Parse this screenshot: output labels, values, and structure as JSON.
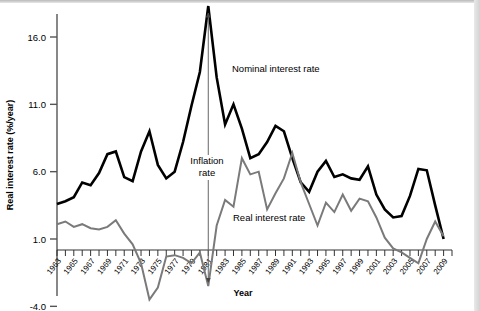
{
  "chart_data": {
    "type": "line",
    "title": "",
    "xlabel": "Year",
    "ylabel": "Real interest rate (%/year)",
    "ylim": [
      -4.0,
      18.8
    ],
    "xlim": [
      1963,
      2010
    ],
    "grid": false,
    "legend": "inline-labels",
    "ytick_labels": [
      "16.0",
      "11.0",
      "6.0",
      "1.0",
      "-4.0"
    ],
    "ytick_values": [
      16.0,
      11.0,
      6.0,
      1.0,
      -4.0
    ],
    "xtick_labels": [
      "1963",
      "1965",
      "1967",
      "1969",
      "1971",
      "1973",
      "1975",
      "1977",
      "1979",
      "1981",
      "1983",
      "1985",
      "1987",
      "1989",
      "1991",
      "1993",
      "1995",
      "1997",
      "1999",
      "2001",
      "2003",
      "2005",
      "2007",
      "2009"
    ],
    "xtick_values": [
      1963,
      1965,
      1967,
      1969,
      1971,
      1973,
      1975,
      1977,
      1979,
      1981,
      1983,
      1985,
      1987,
      1989,
      1991,
      1993,
      1995,
      1997,
      1999,
      2001,
      2003,
      2005,
      2007,
      2009
    ],
    "minor_ticks_every": 1,
    "x": [
      1963,
      1964,
      1965,
      1966,
      1967,
      1968,
      1969,
      1970,
      1971,
      1972,
      1973,
      1974,
      1975,
      1976,
      1977,
      1978,
      1979,
      1980,
      1981,
      1982,
      1983,
      1984,
      1985,
      1986,
      1987,
      1988,
      1989,
      1990,
      1991,
      1992,
      1993,
      1994,
      1995,
      1996,
      1997,
      1998,
      1999,
      2000,
      2001,
      2002,
      2003,
      2004,
      2005,
      2006,
      2007,
      2008,
      2009
    ],
    "series": [
      {
        "name": "Nominal interest rate",
        "color": "#000000",
        "width": 2.6,
        "values": [
          3.6,
          3.8,
          4.1,
          5.2,
          5.0,
          5.9,
          7.3,
          7.5,
          5.6,
          5.3,
          7.5,
          9.0,
          6.5,
          5.5,
          6.0,
          8.2,
          10.9,
          13.4,
          18.3,
          13.0,
          9.5,
          11.0,
          9.2,
          7.0,
          7.3,
          8.2,
          9.4,
          9.0,
          7.0,
          5.2,
          4.5,
          6.0,
          6.8,
          5.6,
          5.8,
          5.5,
          5.4,
          6.4,
          4.3,
          3.2,
          2.6,
          2.7,
          4.2,
          6.2,
          6.1,
          3.5,
          1.0
        ]
      },
      {
        "name": "Real interest rate",
        "color": "#7a7a7a",
        "width": 2.0,
        "values": [
          2.1,
          2.3,
          1.9,
          2.1,
          1.8,
          1.7,
          1.9,
          2.4,
          1.4,
          0.6,
          -0.8,
          -3.5,
          -2.6,
          -0.3,
          -0.2,
          -0.4,
          -0.8,
          0.0,
          -2.5,
          2.0,
          3.9,
          3.4,
          7.0,
          5.8,
          6.0,
          3.2,
          4.4,
          5.5,
          7.4,
          5.2,
          3.6,
          2.0,
          3.7,
          3.0,
          4.3,
          3.1,
          4.0,
          3.8,
          2.6,
          1.1,
          0.3,
          0.0,
          -0.4,
          -0.8,
          1.0,
          2.3,
          1.2
        ]
      }
    ],
    "annotations": [
      {
        "name": "inflation-rate-annotation",
        "text_line1": "Inflation",
        "text_line2": "rate",
        "type": "double-headed-arrow",
        "at_year": 1981
      },
      {
        "name": "nominal-series-label",
        "text": "Nominal interest rate"
      },
      {
        "name": "real-series-label",
        "text": "Real interest rate"
      }
    ]
  },
  "labels": {
    "ylabel": "Real interest rate (%/year)",
    "xlabel": "Year",
    "nominal": "Nominal interest rate",
    "real": "Real interest rate",
    "inflation_line1": "Inflation",
    "inflation_line2": "rate"
  },
  "colors": {
    "nominal": "#000000",
    "real": "#7a7a7a",
    "axis": "#555555",
    "background": "#ffffff"
  }
}
